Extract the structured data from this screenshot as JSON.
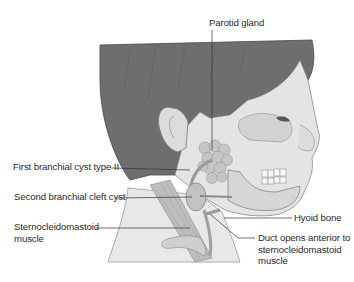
{
  "figure": {
    "type": "anatomical-illustration",
    "colors": {
      "hair": "#6b6b6b",
      "skin": "#e6e6e6",
      "skin_shadow": "#cfcfcf",
      "bone": "#d9d9d9",
      "gland": "#c4c4c4",
      "muscle": "#b8b8b8",
      "line": "#333333",
      "text": "#2a2a2a"
    }
  },
  "labels": {
    "parotid_gland": "Parotid gland",
    "first_branchial_cyst": "First branchial cyst type II",
    "second_branchial_cleft_cyst": "Second branchial cleft cyst",
    "sternocleidomastoid_line1": "Sternocleidomastoid",
    "sternocleidomastoid_line2": "muscle",
    "hyoid_bone": "Hyoid bone",
    "duct_line1": "Duct opens anterior to",
    "duct_line2": "sternocleidomastoid",
    "duct_line3": "muscle"
  }
}
